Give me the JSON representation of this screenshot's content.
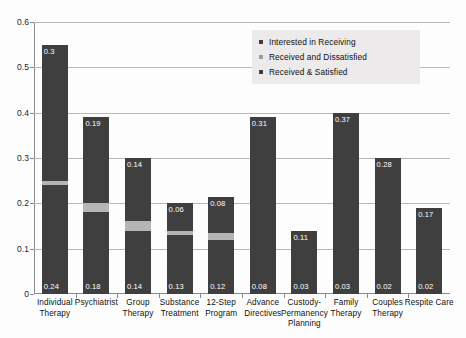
{
  "chart_data": {
    "type": "bar",
    "subtype": "stacked-vertical",
    "title": "",
    "xlabel": "",
    "ylabel": "",
    "ylim": [
      0,
      0.6
    ],
    "ytick_labels": [
      "0",
      "0.1",
      "0.2",
      "0.3",
      "0.4",
      "0.5",
      "0.6"
    ],
    "ytick_values": [
      0,
      0.1,
      0.2,
      0.3,
      0.4,
      0.5,
      0.6
    ],
    "grid": true,
    "legend_position": "top-right",
    "categories": [
      "Individual Therapy",
      "Psychiatrist",
      "Group Therapy",
      "Substance Treatment",
      "12-Step Program",
      "Advance Directives",
      "Custody-Permanency Planning",
      "Family Therapy",
      "Couples Therapy",
      "Respite Care"
    ],
    "category_lines": [
      [
        "Individual",
        "Therapy"
      ],
      [
        "Psychiatrist"
      ],
      [
        "Group Therapy"
      ],
      [
        "Substance",
        "Treatment"
      ],
      [
        "12-Step",
        "Program"
      ],
      [
        "Advance",
        "Directives"
      ],
      [
        "Custody-",
        "Permanency",
        "Planning"
      ],
      [
        "Family",
        "Therapy"
      ],
      [
        "Couples",
        "Therapy"
      ],
      [
        "Respite Care"
      ]
    ],
    "series": [
      {
        "name": "Received & Satisfied",
        "color": "#3f3f3f",
        "values": [
          0.24,
          0.18,
          0.14,
          0.13,
          0.12,
          0.08,
          0.03,
          0.03,
          0.02,
          0.02
        ],
        "labels": [
          "0.24",
          "0.18",
          "0.14",
          "0.13",
          "0.12",
          "0.08",
          "0.03",
          "0.03",
          "0.02",
          "0.02"
        ]
      },
      {
        "name": "Received and Dissatisfied",
        "color": "#b5b5b5",
        "values": [
          0.01,
          0.02,
          0.02,
          0.01,
          0.015,
          0,
          0,
          0,
          0,
          0
        ],
        "labels": [
          "",
          "",
          "",
          "",
          "",
          "",
          "",
          "",
          "",
          ""
        ]
      },
      {
        "name": "Interested in Receiving",
        "color": "#3f3f3f",
        "values": [
          0.3,
          0.19,
          0.14,
          0.06,
          0.08,
          0.31,
          0.11,
          0.37,
          0.28,
          0.17
        ],
        "labels": [
          "0.3",
          "0.19",
          "0.14",
          "0.06",
          "0.08",
          "0.31",
          "0.11",
          "0.37",
          "0.28",
          "0.17"
        ]
      }
    ],
    "totals": [
      0.55,
      0.39,
      0.3,
      0.2,
      0.215,
      0.39,
      0.14,
      0.4,
      0.3,
      0.19
    ]
  },
  "legend": {
    "items": [
      {
        "label": "Interested in Receiving",
        "color": "#3f3f3f"
      },
      {
        "label": "Received and Dissatisfied",
        "color": "#b5b5b5"
      },
      {
        "label": "Received & Satisfied",
        "color": "#3f3f3f"
      }
    ]
  },
  "colors": {
    "bar_dark": "#3f3f3f",
    "bar_light": "#b5b5b5",
    "gridline": "#b9b9b9",
    "axis": "#8a8a8a",
    "legend_background": "#eceaea",
    "text": "#111111",
    "value_label": "#ffffff"
  }
}
